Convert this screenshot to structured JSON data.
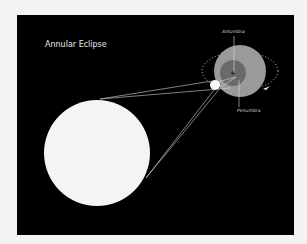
{
  "diagram": {
    "title": "Annular Eclipse",
    "labels": {
      "antumbra": "Antumbra",
      "penumbra": "Penumbra"
    },
    "bodies": {
      "sun": {
        "name": "sun",
        "color": "#f4f4f4"
      },
      "moon": {
        "name": "moon",
        "color": "#f8f8f8"
      },
      "earth_penumbra": {
        "name": "penumbra-region",
        "color": "#9a9a9a"
      },
      "earth_antumbra": {
        "name": "antumbra-region",
        "color": "#6a6a6a"
      }
    },
    "orbit": {
      "style": "dashed",
      "direction_arrow": "clockwise"
    },
    "colors": {
      "background": "#000000",
      "margin": "#f2f2f2",
      "rays": "#d8d8d8",
      "label_text": "#cfcfcf"
    }
  }
}
